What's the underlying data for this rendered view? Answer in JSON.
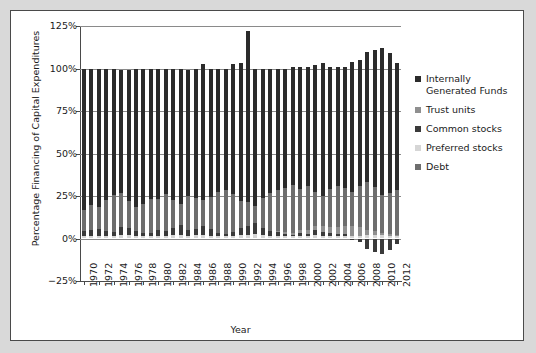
{
  "chart_data": {
    "type": "bar",
    "subtype": "stacked-bar",
    "title": "",
    "xlabel": "Year",
    "ylabel": "Percentage Financing of Capital Expenditures",
    "ylim": [
      -25,
      125
    ],
    "ytick_values": [
      -25,
      0,
      25,
      50,
      75,
      100,
      125
    ],
    "ytick_labels": [
      "−25%",
      "0%",
      "25%",
      "50%",
      "75%",
      "100%",
      "125%"
    ],
    "grid": true,
    "legend_position": "right",
    "x": [
      1970,
      1971,
      1972,
      1973,
      1974,
      1975,
      1976,
      1977,
      1978,
      1979,
      1980,
      1981,
      1982,
      1983,
      1984,
      1985,
      1986,
      1987,
      1988,
      1989,
      1990,
      1991,
      1992,
      1993,
      1994,
      1995,
      1996,
      1997,
      1998,
      1999,
      2000,
      2001,
      2002,
      2003,
      2004,
      2005,
      2006,
      2007,
      2008,
      2009,
      2010,
      2011,
      2012
    ],
    "xtick_labels": [
      "1970",
      "1972",
      "1974",
      "1976",
      "1978",
      "1980",
      "1982",
      "1984",
      "1986",
      "1988",
      "1990",
      "1992",
      "1994",
      "1996",
      "1998",
      "2000",
      "2002",
      "2004",
      "2006",
      "2008",
      "2010",
      "2012"
    ],
    "series": [
      {
        "name": "Preferred stocks",
        "color": "#d6d6d6",
        "values": [
          1.5,
          1.4,
          1.6,
          1.3,
          1.2,
          2.0,
          1.8,
          1.5,
          1.3,
          1.2,
          1.6,
          1.4,
          1.9,
          2.2,
          1.5,
          1.8,
          2.0,
          1.7,
          1.4,
          1.2,
          1.5,
          1.8,
          2.0,
          2.4,
          1.9,
          1.6,
          1.5,
          1.4,
          1.3,
          1.5,
          1.4,
          1.8,
          1.6,
          1.5,
          1.4,
          1.6,
          1.5,
          1.7,
          2.0,
          2.2,
          1.8,
          1.6,
          1.5
        ]
      },
      {
        "name": "Common stocks",
        "color": "#3a3a3a",
        "values": [
          3.0,
          3.5,
          4.0,
          3.2,
          2.5,
          5.0,
          4.5,
          3.0,
          2.2,
          2.0,
          3.5,
          3.0,
          4.5,
          6.0,
          3.5,
          4.0,
          5.5,
          4.0,
          2.0,
          1.5,
          2.5,
          4.5,
          5.5,
          6.5,
          4.0,
          3.0,
          2.5,
          1.5,
          1.0,
          2.0,
          1.5,
          3.0,
          2.5,
          2.0,
          1.5,
          1.0,
          -1.0,
          -2.0,
          -6.0,
          -8.0,
          -9.0,
          -7.0,
          -3.0
        ]
      },
      {
        "name": "Trust units",
        "color": "#8f8f8f",
        "values": [
          0,
          0,
          0,
          0,
          0,
          0,
          0,
          0,
          0,
          0,
          0,
          0,
          0,
          0,
          0,
          0,
          0,
          0,
          0,
          0,
          0,
          0,
          0,
          0,
          0,
          0,
          0.5,
          0.8,
          1.0,
          1.5,
          2.0,
          2.5,
          3.0,
          3.5,
          4.0,
          5.0,
          6.0,
          5.0,
          3.0,
          2.0,
          1.5,
          1.0,
          0.8
        ]
      },
      {
        "name": "Debt",
        "color": "#6e6e6e",
        "values": [
          12.0,
          15.0,
          13.0,
          18.0,
          22.0,
          20.0,
          16.0,
          14.0,
          17.0,
          20.0,
          18.0,
          22.0,
          16.0,
          12.0,
          20.0,
          18.0,
          15.0,
          19.0,
          24.0,
          26.0,
          22.0,
          16.0,
          14.0,
          10.0,
          18.0,
          22.0,
          24.0,
          26.0,
          28.0,
          24.0,
          26.0,
          20.0,
          18.0,
          22.0,
          24.0,
          22.0,
          20.0,
          24.0,
          28.0,
          26.0,
          22.0,
          24.0,
          26.0
        ]
      },
      {
        "name": "Internally Generated Funds",
        "color": "#2b2b2b",
        "values": [
          83.5,
          80.1,
          81.4,
          77.5,
          74.3,
          72.0,
          76.7,
          81.5,
          79.5,
          76.8,
          76.4,
          73.6,
          77.6,
          79.8,
          74.0,
          76.2,
          80.0,
          75.3,
          72.6,
          71.3,
          76.5,
          81.2,
          100.5,
          80.6,
          76.1,
          73.4,
          71.5,
          70.3,
          69.7,
          72.0,
          70.1,
          74.7,
          77.9,
          72.0,
          70.1,
          71.4,
          76.5,
          74.3,
          77.0,
          80.8,
          86.7,
          82.4,
          74.7
        ]
      }
    ],
    "totals_note": "Stacked bars sum to approximately 100% each year",
    "annotations": [
      {
        "year": 1992,
        "value": 122,
        "note": "peak total above 125% gridline"
      },
      {
        "year": 1992,
        "value": -22,
        "note": "deep negative common stock segment"
      },
      {
        "year": 2010,
        "value": -13,
        "note": "largest negative segment"
      }
    ]
  },
  "legend": {
    "items": [
      {
        "label": "Internally Generated Funds",
        "color": "#2b2b2b"
      },
      {
        "label": "Trust units",
        "color": "#8f8f8f"
      },
      {
        "label": "Common stocks",
        "color": "#3a3a3a"
      },
      {
        "label": "Preferred stocks",
        "color": "#d6d6d6"
      },
      {
        "label": "Debt",
        "color": "#6e6e6e"
      }
    ]
  }
}
